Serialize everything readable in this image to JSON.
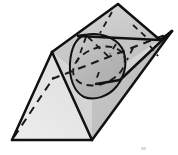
{
  "figure": {
    "canvas": {
      "width": 178,
      "height": 155,
      "background": "#ffffff"
    },
    "colors": {
      "outline": "#111111",
      "hidden_line": "#1a1a1a",
      "prism_front_face": "#e9e9e9",
      "prism_left_face": "#d2d2d2",
      "prism_top_face": "#c6c6c6",
      "plane_upper": "#cdcdcd",
      "plane_right_wing": "#d8d8d8",
      "cone_surface": "#b9b9b9",
      "artifact": "#cfcfcf"
    },
    "stroke_widths": {
      "outline": 2.4,
      "hidden": 1.8,
      "cone": 2.0
    },
    "dash_patterns": {
      "hidden_ridge": "7 5",
      "cone_ellipse": "6 5",
      "plane_hidden": "6 5"
    },
    "shapes": {
      "prism_front_triangle": "12,140 92,140 52,52",
      "prism_left_face": "12,140 52,52 118,4 78,92",
      "prism_top_face": "52,52 118,4 160,40 92,86",
      "prism_right_face": "92,140 92,86 160,40 172,31",
      "plane_upper_blade": "118,4 160,40 78,36",
      "plane_right_wing": "160,40 172,31 118,78 92,86",
      "cone_outline": "85,35 108,34 122,46 124,64 116,86 101,99 86,98 75,84 70,62 74,45",
      "hidden_ridge_line": "52,78 168,33",
      "cone_base_ellipse_cx": 99,
      "cone_base_ellipse_cy": 66
    },
    "labels": {
      "caption": ""
    }
  }
}
